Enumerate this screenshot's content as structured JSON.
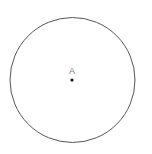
{
  "diagram": {
    "type": "geometry",
    "circle": {
      "center_x": 72.5,
      "center_y": 80,
      "radius": 62.5,
      "stroke_color": "#555555",
      "stroke_width": 1,
      "fill": "none"
    },
    "points": [
      {
        "label": "A",
        "x": 72,
        "y": 80,
        "label_x": 72,
        "label_y": 67,
        "dot_color": "#111111",
        "label_color": "#7a7a7a"
      }
    ]
  }
}
